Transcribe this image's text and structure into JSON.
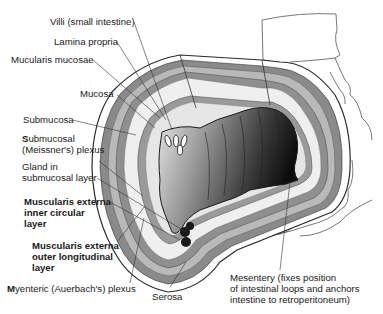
{
  "diagram": {
    "labels": {
      "villi": "Villi (small intestine)",
      "lamina_propria": "Lamina propria",
      "muscularis_mucosae": "Mucularis mucosae",
      "mucosa": "Mucosa",
      "submucosa": "Submucosa",
      "submucosal_plexus_line1_first": "S",
      "submucosal_plexus_line1_rest": "ubmucosal",
      "submucosal_plexus_line2": "(Meissner's) plexus",
      "gland_line1": "Gland in",
      "gland_line2": "submucosal layer",
      "inner_circular_line1": "Muscularis externa",
      "inner_circular_line2": "inner circular",
      "inner_circular_line3": "layer",
      "outer_longitudinal_line1": "Muscularis externa",
      "outer_longitudinal_line2": "outer longitudinal",
      "outer_longitudinal_line3": "layer",
      "myenteric_first": "M",
      "myenteric_rest": "yenteric (Auerbach's) plexus",
      "serosa": "Serosa",
      "mesentery_line1": "Mesentery (fixes position",
      "mesentery_line2": "of intestinal loops and anchors",
      "mesentery_line3": "intestine to retroperitoneum)"
    },
    "colors": {
      "outline": "#2a2a2a",
      "muscle_band": "#8a8a8a",
      "submucosa": "#ececec",
      "lumen_dark": "#1a1a1a",
      "lumen_light": "#d8d8d8"
    }
  }
}
